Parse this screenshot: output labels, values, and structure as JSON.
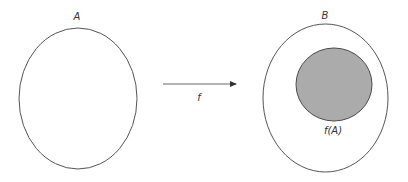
{
  "diagram": {
    "domain_set": {
      "label": "A"
    },
    "codomain_set": {
      "label": "B"
    },
    "image_set": {
      "label": "f(A)",
      "fill_color": "#ababab",
      "stroke_color": "#4a4a4a"
    },
    "mapping_arrow": {
      "label": "f",
      "color": "#555555"
    }
  }
}
